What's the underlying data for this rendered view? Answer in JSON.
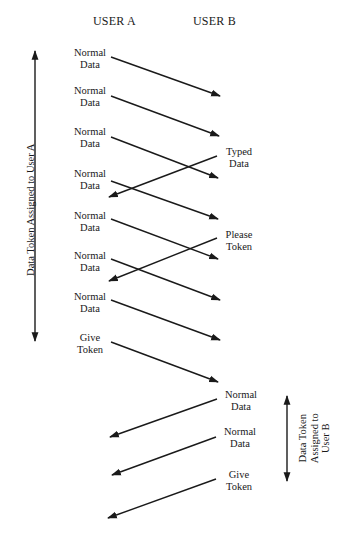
{
  "headers": {
    "user_a": "USER A",
    "user_b": "USER B"
  },
  "left_messages": [
    {
      "line1": "Normal",
      "line2": "Data"
    },
    {
      "line1": "Normal",
      "line2": "Data"
    },
    {
      "line1": "Normal",
      "line2": "Data"
    },
    {
      "line1": "Normal",
      "line2": "Data"
    },
    {
      "line1": "Normal",
      "line2": "Data"
    },
    {
      "line1": "Normal",
      "line2": "Data"
    },
    {
      "line1": "Normal",
      "line2": "Data"
    },
    {
      "line1": "Give",
      "line2": "Token"
    }
  ],
  "right_messages": [
    {
      "line1": "Typed",
      "line2": "Data"
    },
    {
      "line1": "Please",
      "line2": "Token"
    },
    {
      "line1": "Normal",
      "line2": "Data"
    },
    {
      "line1": "Normal",
      "line2": "Data"
    },
    {
      "line1": "Give",
      "line2": "Token"
    }
  ],
  "spans": {
    "user_a": {
      "label": "Data Token Assigned to User A"
    },
    "user_b": {
      "line1": "Data Token",
      "line2": "Assigned to",
      "line3": "User B"
    }
  },
  "colors": {
    "line": "#1a1a1a",
    "background": "#ffffff"
  }
}
